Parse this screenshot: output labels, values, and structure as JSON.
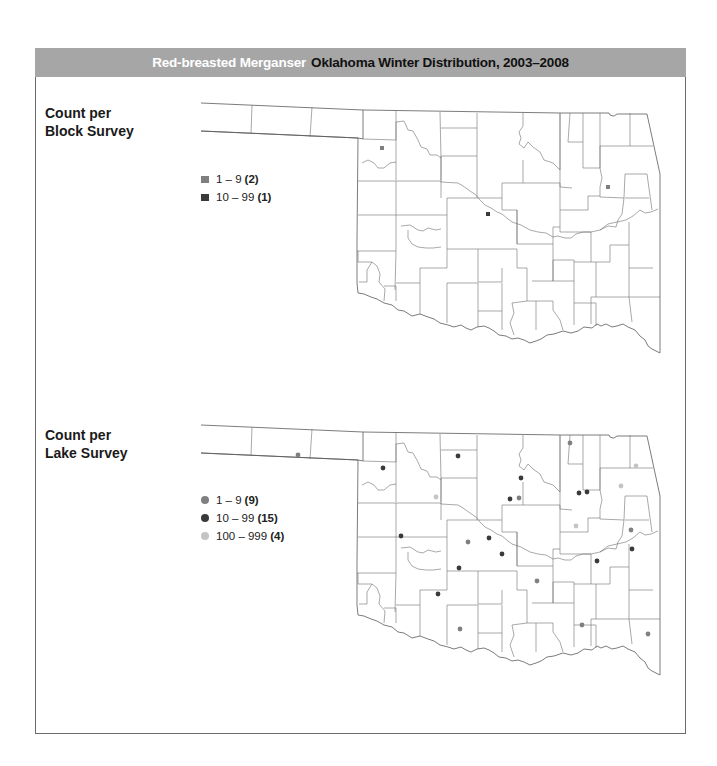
{
  "title": {
    "species": "Red-breasted Merganser",
    "rest": "Oklahoma Winter Distribution, 2003–2008",
    "bar_color": "#a6a6a6"
  },
  "block_map": {
    "label_line1": "Count per",
    "label_line2": "Block Survey",
    "legend": [
      {
        "range": "1 – 9",
        "count": "(2)",
        "color": "#7f7f7f",
        "shape": "square"
      },
      {
        "range": "10 – 99",
        "count": "(1)",
        "color": "#3a3a3a",
        "shape": "square"
      }
    ],
    "points": [
      {
        "x": 382,
        "y": 148,
        "class": "1-9"
      },
      {
        "x": 608,
        "y": 187,
        "class": "1-9"
      },
      {
        "x": 488,
        "y": 214,
        "class": "10-99"
      }
    ]
  },
  "lake_map": {
    "label_line1": "Count per",
    "label_line2": "Lake Survey",
    "legend": [
      {
        "range": "1 – 9",
        "count": "(9)",
        "color": "#808080",
        "shape": "circle"
      },
      {
        "range": "10 – 99",
        "count": "(15)",
        "color": "#3a3a3a",
        "shape": "circle"
      },
      {
        "range": "100 – 999",
        "count": "(4)",
        "color": "#c4c4c4",
        "shape": "circle"
      }
    ],
    "points": [
      {
        "x": 298,
        "y": 455,
        "class": "1-9"
      },
      {
        "x": 383,
        "y": 468,
        "class": "10-99"
      },
      {
        "x": 458,
        "y": 456,
        "class": "10-99"
      },
      {
        "x": 570,
        "y": 443,
        "class": "1-9"
      },
      {
        "x": 636,
        "y": 466,
        "class": "100-999"
      },
      {
        "x": 521,
        "y": 478,
        "class": "10-99"
      },
      {
        "x": 621,
        "y": 486,
        "class": "100-999"
      },
      {
        "x": 436,
        "y": 497,
        "class": "100-999"
      },
      {
        "x": 510,
        "y": 499,
        "class": "10-99"
      },
      {
        "x": 519,
        "y": 498,
        "class": "1-9"
      },
      {
        "x": 579,
        "y": 493,
        "class": "10-99"
      },
      {
        "x": 587,
        "y": 492,
        "class": "10-99"
      },
      {
        "x": 401,
        "y": 536,
        "class": "10-99"
      },
      {
        "x": 468,
        "y": 542,
        "class": "1-9"
      },
      {
        "x": 489,
        "y": 538,
        "class": "10-99"
      },
      {
        "x": 631,
        "y": 530,
        "class": "1-9"
      },
      {
        "x": 502,
        "y": 554,
        "class": "10-99"
      },
      {
        "x": 459,
        "y": 568,
        "class": "10-99"
      },
      {
        "x": 632,
        "y": 549,
        "class": "10-99"
      },
      {
        "x": 597,
        "y": 561,
        "class": "10-99"
      },
      {
        "x": 537,
        "y": 581,
        "class": "1-9"
      },
      {
        "x": 438,
        "y": 594,
        "class": "10-99"
      },
      {
        "x": 460,
        "y": 629,
        "class": "1-9"
      },
      {
        "x": 582,
        "y": 625,
        "class": "1-9"
      },
      {
        "x": 648,
        "y": 634,
        "class": "1-9"
      },
      {
        "x": 576,
        "y": 526,
        "class": "100-999"
      }
    ]
  }
}
